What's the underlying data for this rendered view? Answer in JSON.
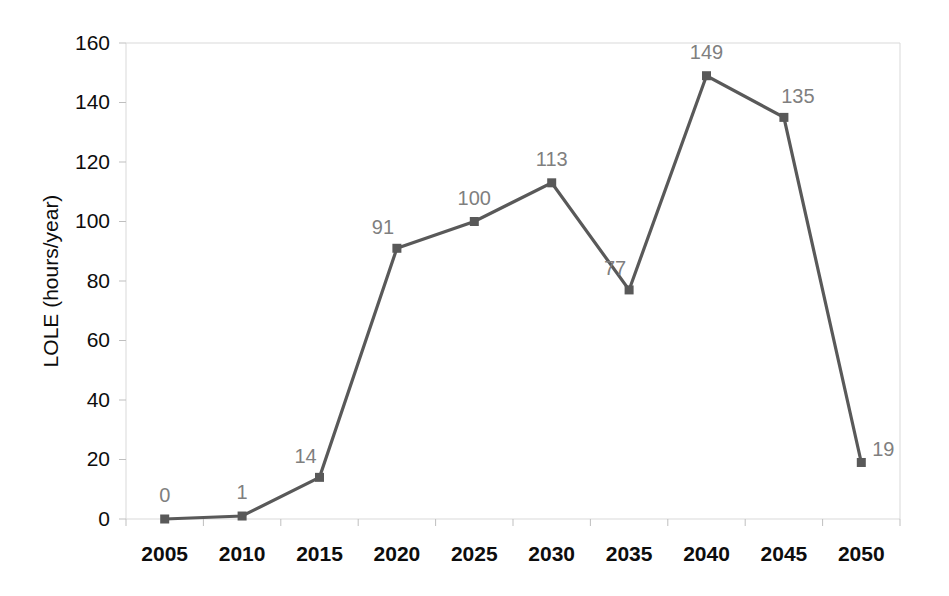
{
  "chart_data": {
    "type": "line",
    "title": "",
    "xlabel": "",
    "ylabel": "LOLE (hours/year)",
    "categories": [
      "2005",
      "2010",
      "2015",
      "2020",
      "2025",
      "2030",
      "2035",
      "2040",
      "2045",
      "2050"
    ],
    "x": [
      2005,
      2010,
      2015,
      2020,
      2025,
      2030,
      2035,
      2040,
      2045,
      2050
    ],
    "values": [
      0,
      1,
      14,
      91,
      100,
      113,
      77,
      149,
      135,
      19
    ],
    "data_labels": [
      "0",
      "1",
      "14",
      "91",
      "100",
      "113",
      "77",
      "149",
      "135",
      "19"
    ],
    "ylim": [
      0,
      160
    ],
    "yticks": [
      0,
      20,
      40,
      60,
      80,
      100,
      120,
      140,
      160
    ],
    "ytick_labels": [
      "0",
      "20",
      "40",
      "60",
      "80",
      "100",
      "120",
      "140",
      "160"
    ],
    "grid": false,
    "legend": null,
    "series_color": "#595959",
    "marker_color": "#595959",
    "data_label_color": "#7f7f7f",
    "axis_text_color": "#0d0d0d",
    "plot_border_color": "#d9d9d9",
    "background_color": "#ffffff",
    "marker_style": "square",
    "label_positions": [
      "above",
      "above",
      "above-left",
      "above-left",
      "above",
      "above",
      "above-left",
      "above",
      "above-right",
      "right"
    ]
  }
}
